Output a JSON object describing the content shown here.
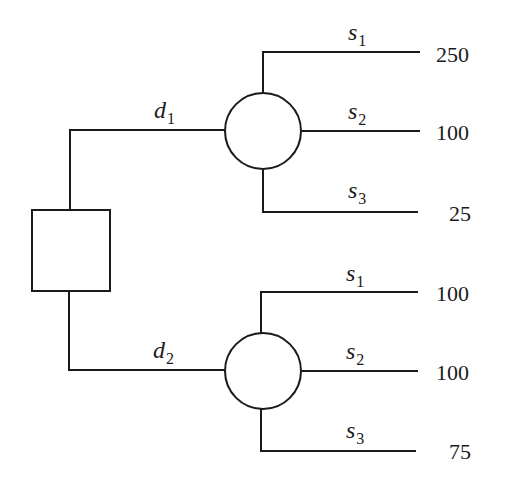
{
  "diagram": {
    "type": "decision-tree",
    "decision_node": {
      "shape": "square"
    },
    "branches": [
      {
        "decision": {
          "symbol": "d",
          "index": "1"
        },
        "chance_node": {
          "shape": "circle"
        },
        "outcomes": [
          {
            "state": {
              "symbol": "s",
              "index": "1"
            },
            "payoff": "250"
          },
          {
            "state": {
              "symbol": "s",
              "index": "2"
            },
            "payoff": "100"
          },
          {
            "state": {
              "symbol": "s",
              "index": "3"
            },
            "payoff": "25"
          }
        ]
      },
      {
        "decision": {
          "symbol": "d",
          "index": "2"
        },
        "chance_node": {
          "shape": "circle"
        },
        "outcomes": [
          {
            "state": {
              "symbol": "s",
              "index": "1"
            },
            "payoff": "100"
          },
          {
            "state": {
              "symbol": "s",
              "index": "2"
            },
            "payoff": "100"
          },
          {
            "state": {
              "symbol": "s",
              "index": "3"
            },
            "payoff": "75"
          }
        ]
      }
    ]
  }
}
